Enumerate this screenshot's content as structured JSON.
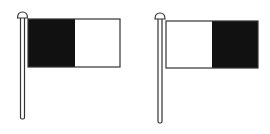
{
  "figure": {
    "colors": {
      "dark": "#111111",
      "light": "#ffffff",
      "outline": "#333333",
      "background": "#ffffff"
    },
    "flags": [
      {
        "name": "left-flag",
        "pole": {
          "x": 22.5,
          "top": 14,
          "bottom": 119,
          "cap_y": 14
        },
        "flag": {
          "x": 28,
          "y": 19,
          "width": 92,
          "height": 48
        },
        "halves": [
          {
            "side": "hoist",
            "fill": "dark"
          },
          {
            "side": "fly",
            "fill": "light"
          }
        ]
      },
      {
        "name": "right-flag",
        "pole": {
          "x": 160,
          "top": 15,
          "bottom": 123,
          "cap_y": 15
        },
        "flag": {
          "x": 166,
          "y": 21,
          "width": 92,
          "height": 47
        },
        "halves": [
          {
            "side": "hoist",
            "fill": "light"
          },
          {
            "side": "fly",
            "fill": "dark"
          }
        ]
      }
    ]
  }
}
